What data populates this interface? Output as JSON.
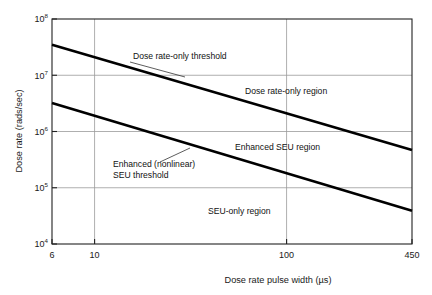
{
  "chart_data": {
    "type": "line",
    "title": "",
    "subtitle": "",
    "xlabel": "Dose rate pulse width (µs)",
    "ylabel": "Dose rate (rads/sec)",
    "xscale": "log",
    "yscale": "log",
    "xlim": [
      6,
      450
    ],
    "ylim": [
      10000,
      100000000
    ],
    "grid": true,
    "legend_position": "none",
    "x_ticks": [
      {
        "value": 6,
        "label": "6"
      },
      {
        "value": 10,
        "label": "10"
      },
      {
        "value": 100,
        "label": "100"
      },
      {
        "value": 450,
        "label": "450"
      }
    ],
    "y_ticks": [
      {
        "value": 10000,
        "mantissa": "10",
        "exponent": "4"
      },
      {
        "value": 100000,
        "mantissa": "10",
        "exponent": "5"
      },
      {
        "value": 1000000,
        "mantissa": "10",
        "exponent": "6"
      },
      {
        "value": 10000000,
        "mantissa": "10",
        "exponent": "7"
      },
      {
        "value": 100000000,
        "mantissa": "10",
        "exponent": "8"
      }
    ],
    "series": [
      {
        "name": "Dose rate-only threshold",
        "x": [
          6,
          450
        ],
        "y": [
          35000000,
          470000
        ]
      },
      {
        "name": "Enhanced (nonlinear) SEU threshold",
        "x": [
          6,
          450
        ],
        "y": [
          3200000,
          39000
        ]
      }
    ],
    "annotations": [
      {
        "id": "dose-rate-only-threshold",
        "lines": [
          "Dose rate-only threshold"
        ],
        "text_x": 133,
        "text_y": 59,
        "leader": [
          [
            130,
            62
          ],
          [
            185,
            77
          ]
        ]
      },
      {
        "id": "enhanced-seu-threshold",
        "lines": [
          "Enhanced (nonlinear)",
          "SEU threshold"
        ],
        "text_x": 113,
        "text_y": 167,
        "leader": [
          [
            160,
            162
          ],
          [
            190,
            148
          ]
        ]
      }
    ],
    "region_labels": [
      {
        "id": "dose-rate-only-region",
        "text": "Dose rate-only region",
        "x": 245,
        "y": 94
      },
      {
        "id": "enhanced-seu-region",
        "text": "Enhanced SEU region",
        "x": 235,
        "y": 150
      },
      {
        "id": "seu-only-region",
        "text": "SEU-only region",
        "x": 208,
        "y": 214
      }
    ]
  },
  "colors": {
    "background": "#ffffff",
    "axis": "#222222",
    "grid": "#9a9a9a",
    "series": "#000000",
    "text": "#1a1a1a"
  }
}
